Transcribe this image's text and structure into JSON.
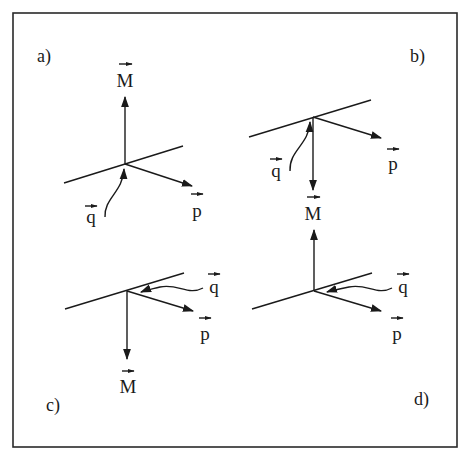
{
  "figure": {
    "panels": [
      {
        "id": "a",
        "label": "a)",
        "vectors": {
          "M": "M",
          "p": "p",
          "q": "q"
        },
        "M_direction": "up",
        "q_side": "below"
      },
      {
        "id": "b",
        "label": "b)",
        "vectors": {
          "M": "M",
          "p": "p",
          "q": "q"
        },
        "M_direction": "down",
        "q_side": "below"
      },
      {
        "id": "c",
        "label": "c)",
        "vectors": {
          "M": "M",
          "p": "p",
          "q": "q"
        },
        "M_direction": "down",
        "q_side": "right"
      },
      {
        "id": "d",
        "label": "d)",
        "vectors": {
          "M": "M",
          "p": "p",
          "q": "q"
        },
        "M_direction": "up",
        "q_side": "right"
      }
    ]
  }
}
